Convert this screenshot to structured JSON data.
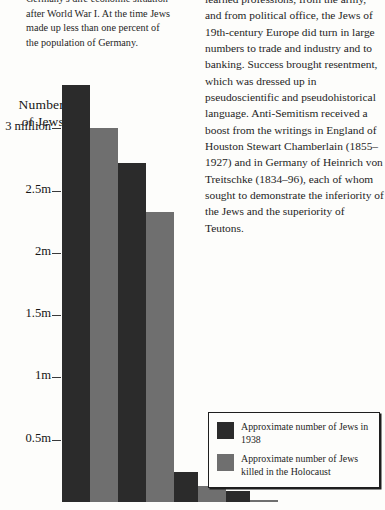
{
  "document": {
    "left_column": {
      "intro_paragraph_lines": [
        "Germany's dire economic situation",
        "after World War I. At the time Jews",
        "made up less than one percent of",
        "the population of Germany."
      ]
    },
    "right_column": {
      "body_paragraph": "learned professions, from the army, and from political office, the Jews of 19th-century Europe did turn in large numbers to trade and industry and to banking. Success brought resentment, which was dressed up in pseudoscientific and pseudohistorical language. Anti-Semitism received a boost from the writings in England of Houston Stewart Chamberlain (1855–1927) and in Germany of Heinrich von Treitschke (1834–96), each of whom sought to demonstrate the inferiority of the Jews and the superiority of Teutons."
    }
  },
  "chart_data": {
    "type": "bar",
    "title": "",
    "ylabel": "Number of Jews",
    "ylabel_lines": [
      "Number",
      "of Jews"
    ],
    "xlabel": "",
    "grid": false,
    "legend_position": "bottom-right",
    "ylim": [
      0,
      3.55
    ],
    "tick_values": [
      3.0,
      2.5,
      2.0,
      1.5,
      1.0,
      0.5
    ],
    "tick_labels": [
      "3 million",
      "2.5m",
      "2m",
      "1.5m",
      "1m",
      "0.5m"
    ],
    "units": "millions of people",
    "series": [
      {
        "name": "Approximate number of Jews in 1938",
        "color": "#2b2b2b",
        "values": [
          3.35,
          2.72,
          0.24,
          0.09
        ]
      },
      {
        "name": "Approximate number of Jews killed in the Holocaust",
        "color": "#6f6f6f",
        "values": [
          3.0,
          2.33,
          0.13,
          0.02
        ]
      }
    ]
  },
  "legend": {
    "items": [
      {
        "swatch": "dark",
        "color": "#2b2b2b",
        "label": "Approximate number of Jews in 1938"
      },
      {
        "swatch": "gray",
        "color": "#6f6f6f",
        "label": "Approximate number of Jews killed in the Holocaust"
      }
    ]
  }
}
